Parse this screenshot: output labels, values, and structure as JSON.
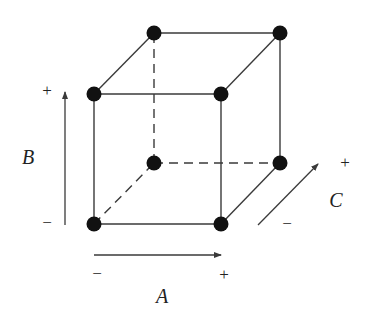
{
  "diagram": {
    "type": "factorial-design-cube",
    "colors": {
      "line": "#3a3a3a",
      "vertex": "#111111",
      "text": "#222222"
    },
    "factors": [
      {
        "name": "A",
        "low": "−",
        "high": "+",
        "direction": "horizontal"
      },
      {
        "name": "B",
        "low": "−",
        "high": "+",
        "direction": "vertical"
      },
      {
        "name": "C",
        "low": "−",
        "high": "+",
        "direction": "depth"
      }
    ],
    "vertices": [
      {
        "id": "front-bottom-left",
        "x": 94,
        "y": 224
      },
      {
        "id": "front-bottom-right",
        "x": 221,
        "y": 224
      },
      {
        "id": "front-top-left",
        "x": 94,
        "y": 94
      },
      {
        "id": "front-top-right",
        "x": 221,
        "y": 94
      },
      {
        "id": "back-bottom-left",
        "x": 154,
        "y": 163
      },
      {
        "id": "back-bottom-right",
        "x": 280,
        "y": 163
      },
      {
        "id": "back-top-left",
        "x": 154,
        "y": 33
      },
      {
        "id": "back-top-right",
        "x": 280,
        "y": 33
      }
    ],
    "edges": [
      {
        "from": 0,
        "to": 1,
        "style": "solid"
      },
      {
        "from": 2,
        "to": 3,
        "style": "solid"
      },
      {
        "from": 0,
        "to": 2,
        "style": "solid"
      },
      {
        "from": 1,
        "to": 3,
        "style": "solid"
      },
      {
        "from": 6,
        "to": 7,
        "style": "solid"
      },
      {
        "from": 5,
        "to": 7,
        "style": "solid"
      },
      {
        "from": 2,
        "to": 6,
        "style": "solid"
      },
      {
        "from": 3,
        "to": 7,
        "style": "solid"
      },
      {
        "from": 1,
        "to": 5,
        "style": "solid"
      },
      {
        "from": 4,
        "to": 6,
        "style": "dashed"
      },
      {
        "from": 4,
        "to": 5,
        "style": "dashed"
      },
      {
        "from": 0,
        "to": 4,
        "style": "dashed"
      }
    ],
    "labels": {
      "A": "A",
      "A_minus": "−",
      "A_plus": "+",
      "B": "B",
      "B_minus": "−",
      "B_plus": "+",
      "C": "C",
      "C_minus": "−",
      "C_plus": "+"
    }
  }
}
